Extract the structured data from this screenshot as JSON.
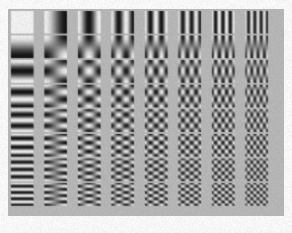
{
  "figure": {
    "kind": "dct-basis-function-grid",
    "caption": "",
    "panel": {
      "background_color": "#b9b9b9",
      "x": 8,
      "y": 9,
      "width": 276,
      "height": 207
    },
    "page_background_color": "#fdfdfd"
  },
  "chart_data": {
    "type": "heatmap",
    "title": "",
    "subtitle": "",
    "xlabel": "",
    "ylabel": "",
    "grid": {
      "rows": 8,
      "cols": 8
    },
    "x": [
      0,
      1,
      2,
      3,
      4,
      5,
      6,
      7
    ],
    "y": [
      0,
      1,
      2,
      3,
      4,
      5,
      6,
      7
    ],
    "xtick_labels": [
      "0",
      "1",
      "2",
      "3",
      "4",
      "5",
      "6",
      "7"
    ],
    "ytick_labels": [
      "0",
      "1",
      "2",
      "3",
      "4",
      "5",
      "6",
      "7"
    ],
    "axis_u_label": "horizontal frequency u",
    "axis_v_label": "vertical frequency v",
    "grid_visible": false,
    "legend": [],
    "colormap": "grayscale",
    "value_range": [
      -1,
      1
    ],
    "tile_low_color": "#141414",
    "tile_high_color": "#f4f4f4",
    "tile_mid_color": "#8a8a8a",
    "tile": {
      "size_px": 22,
      "pitch_x_px": 33.5,
      "pitch_y_px": 24.6,
      "offset_x_px": 3,
      "offset_y_px": 2,
      "samples_per_side": 22
    },
    "values": [
      [
        [
          0,
          0
        ],
        [
          1,
          0
        ],
        [
          2,
          0
        ],
        [
          3,
          0
        ],
        [
          4,
          0
        ],
        [
          5,
          0
        ],
        [
          6,
          0
        ],
        [
          7,
          0
        ]
      ],
      [
        [
          0,
          1
        ],
        [
          1,
          1
        ],
        [
          2,
          1
        ],
        [
          3,
          1
        ],
        [
          4,
          1
        ],
        [
          5,
          1
        ],
        [
          6,
          1
        ],
        [
          7,
          1
        ]
      ],
      [
        [
          0,
          2
        ],
        [
          1,
          2
        ],
        [
          2,
          2
        ],
        [
          3,
          2
        ],
        [
          4,
          2
        ],
        [
          5,
          2
        ],
        [
          6,
          2
        ],
        [
          7,
          2
        ]
      ],
      [
        [
          0,
          3
        ],
        [
          1,
          3
        ],
        [
          2,
          3
        ],
        [
          3,
          3
        ],
        [
          4,
          3
        ],
        [
          5,
          3
        ],
        [
          6,
          3
        ],
        [
          7,
          3
        ]
      ],
      [
        [
          0,
          4
        ],
        [
          1,
          4
        ],
        [
          2,
          4
        ],
        [
          3,
          4
        ],
        [
          4,
          4
        ],
        [
          5,
          4
        ],
        [
          6,
          4
        ],
        [
          7,
          4
        ]
      ],
      [
        [
          0,
          5
        ],
        [
          1,
          5
        ],
        [
          2,
          5
        ],
        [
          3,
          5
        ],
        [
          4,
          5
        ],
        [
          5,
          5
        ],
        [
          6,
          5
        ],
        [
          7,
          5
        ]
      ],
      [
        [
          0,
          6
        ],
        [
          1,
          6
        ],
        [
          2,
          6
        ],
        [
          3,
          6
        ],
        [
          4,
          6
        ],
        [
          5,
          6
        ],
        [
          6,
          6
        ],
        [
          7,
          6
        ]
      ],
      [
        [
          0,
          7
        ],
        [
          1,
          7
        ],
        [
          2,
          7
        ],
        [
          3,
          7
        ],
        [
          4,
          7
        ],
        [
          5,
          7
        ],
        [
          6,
          7
        ],
        [
          7,
          7
        ]
      ]
    ]
  }
}
